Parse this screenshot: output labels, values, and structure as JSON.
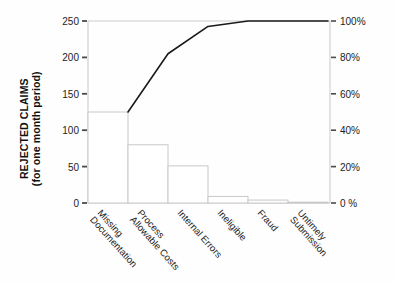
{
  "chart_data": {
    "type": "bar",
    "title": "",
    "subtitle": "",
    "ylabel_line1": "REJECTED CLAIMS",
    "ylabel_line2": "(for one month period)",
    "xlabel": "",
    "y2label": "",
    "categories": [
      "Missing Documentation",
      "Process Allowable Costs",
      "Internal Errors",
      "Ineligible",
      "Fraud",
      "Untimely Submission"
    ],
    "category_lines": [
      [
        "Missing",
        "Documentation"
      ],
      [
        "Process",
        "Allowable Costs"
      ],
      [
        "Internal Errors"
      ],
      [
        "Ineligible"
      ],
      [
        "Fraud"
      ],
      [
        "Untimely",
        "Submission"
      ]
    ],
    "series": [
      {
        "name": "Rejected claims",
        "kind": "bar",
        "axis": "left",
        "values": [
          125,
          80,
          51,
          9,
          4,
          1
        ]
      },
      {
        "name": "Cumulative percent",
        "kind": "line",
        "axis": "right",
        "values": [
          50,
          82,
          97,
          100,
          100,
          100
        ]
      }
    ],
    "ylim": [
      0,
      250
    ],
    "y2lim": [
      0,
      100
    ],
    "yticks": [
      0,
      50,
      100,
      150,
      200,
      250
    ],
    "ytick_labels": [
      "0",
      "50",
      "100",
      "150",
      "200",
      "250"
    ],
    "y2ticks": [
      0,
      20,
      40,
      60,
      80,
      100
    ],
    "y2tick_labels": [
      "0 %",
      "20%",
      "40%",
      "60%",
      "80%",
      "100%"
    ],
    "grid": false,
    "legend": "none",
    "bar_fill": "#ffffff",
    "bar_stroke": "#c8c8c8",
    "line_color": "#1a1a1a",
    "axis_color": "#cccccc",
    "tick_color": "#4a4a4a",
    "text_color": "#1d1d1d",
    "background": "#fefefe"
  }
}
